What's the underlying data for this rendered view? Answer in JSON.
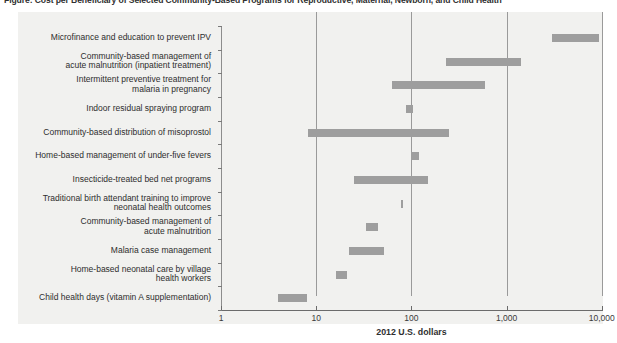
{
  "figure": {
    "title": "Figure: Cost per Beneficiary of Selected Community-Based Programs for Reproductive, Maternal, Newborn, and Child Health",
    "panel_background": "#f1f1ef",
    "bar_color": "#9e9e9e",
    "gridline_color": "#9a9a9a"
  },
  "chart_data": {
    "type": "bar",
    "orientation": "horizontal",
    "subtype": "range-bar",
    "title": "Figure: Cost per Beneficiary of Selected Community-Based Programs for Reproductive, Maternal, Newborn, and Child Health",
    "xlabel": "2012 U.S. dollars",
    "ylabel": "",
    "xscale": "log",
    "xlim": [
      1,
      10000
    ],
    "xticks": [
      1,
      10,
      100,
      1000,
      10000
    ],
    "xtick_labels": [
      "1",
      "10",
      "100",
      "1,000",
      "10,000"
    ],
    "grid": "vertical gridlines at 10, 100, 1,000 and 10,000",
    "legend": "none",
    "categories": [
      "Microfinance and education to prevent IPV",
      "Community-based management of\nacute malnutrition (inpatient treatment)",
      "Intermittent preventive treatment for\nmalaria in pregnancy",
      "Indoor residual spraying program",
      "Community-based distribution of misoprostol",
      "Home-based management of under-five fevers",
      "Insecticide-treated bed net programs",
      "Traditional birth attendant training to improve\nneonatal health outcomes",
      "Community-based management of\nacute malnutrition",
      "Malaria case management",
      "Home-based neonatal care by village\nhealth workers",
      "Child health days (vitamin A supplementation)"
    ],
    "ranges": [
      {
        "label": "Microfinance and education to prevent IPV",
        "low": 3000,
        "high": 9300
      },
      {
        "label": "Community-based management of acute malnutrition (inpatient treatment)",
        "low": 230,
        "high": 1400
      },
      {
        "label": "Intermittent preventive treatment for malaria in pregnancy",
        "low": 63,
        "high": 600
      },
      {
        "label": "Indoor residual spraying program",
        "low": 87,
        "high": 105
      },
      {
        "label": "Community-based distribution of misoprostol",
        "low": 8.2,
        "high": 250
      },
      {
        "label": "Home-based management of under-five fevers",
        "low": 100,
        "high": 120
      },
      {
        "label": "Insecticide-treated bed net programs",
        "low": 25,
        "high": 150
      },
      {
        "label": "Traditional birth attendant training to improve neonatal health outcomes",
        "low": 77,
        "high": 82
      },
      {
        "label": "Community-based management of acute malnutrition",
        "low": 33,
        "high": 45
      },
      {
        "label": "Malaria case management",
        "low": 22,
        "high": 52
      },
      {
        "label": "Home-based neonatal care by village health workers",
        "low": 16,
        "high": 21
      },
      {
        "label": "Child health days (vitamin A supplementation)",
        "low": 4.0,
        "high": 8.1
      }
    ]
  }
}
